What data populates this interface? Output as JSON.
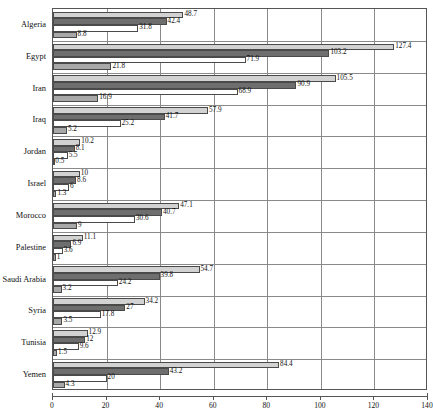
{
  "chart_data": {
    "type": "bar",
    "orientation": "horizontal",
    "title": "",
    "subtitle": "",
    "xlabel": "",
    "ylabel": "",
    "xlim": [
      0,
      140
    ],
    "xticks": [
      0,
      20,
      40,
      60,
      80,
      100,
      120,
      140
    ],
    "grid": true,
    "grid_axis": "x",
    "legend": false,
    "legend_position": "none",
    "categories": [
      "Algeria",
      "Egypt",
      "Iran",
      "Iraq",
      "Jordan",
      "Israel",
      "Morocco",
      "Palestine",
      "Saudi Arabia",
      "Syria",
      "Tunisia",
      "Yemen"
    ],
    "series": [
      {
        "name": "series-1",
        "color": "#d2d2d2",
        "values": [
          48.7,
          127.4,
          105.5,
          57.9,
          10.2,
          10,
          47.1,
          11.1,
          54.7,
          34.2,
          12.9,
          84.4
        ],
        "labels": [
          "48.7",
          "127.4",
          "105.5",
          "57.9",
          "10.2",
          "10",
          "47.1",
          "11.1",
          "54.7",
          "34.2",
          "12.9",
          "84.4"
        ]
      },
      {
        "name": "series-2",
        "color": "#6e6e6e",
        "values": [
          42.4,
          103.2,
          90.9,
          41.7,
          8.1,
          8.6,
          40.7,
          6.9,
          39.8,
          27,
          12,
          43.2
        ],
        "labels": [
          "42.4",
          "103.2",
          "90.9",
          "41.7",
          "8.1",
          "8.6",
          "40.7",
          "6.9",
          "39.8",
          "27",
          "12",
          "43.2"
        ]
      },
      {
        "name": "series-3",
        "color": "#ffffff",
        "values": [
          31.8,
          71.9,
          68.9,
          25.2,
          5.5,
          6,
          30.6,
          3.6,
          24.2,
          17.8,
          9.6,
          20
        ],
        "labels": [
          "31.8",
          "71.9",
          "68.9",
          "25.2",
          "5.5",
          "6",
          "30.6",
          "3.6",
          "24.2",
          "17.8",
          "9.6",
          "20"
        ]
      },
      {
        "name": "series-4",
        "color": "#a8a8a8",
        "values": [
          8.8,
          21.8,
          16.9,
          5.2,
          0.5,
          1.3,
          9,
          1,
          3.2,
          3.5,
          1.5,
          4.3
        ],
        "labels": [
          "8.8",
          "21.8",
          "16.9",
          "5.2",
          "0.5",
          "1.3",
          "9",
          "1",
          "3.2",
          "3.5",
          "1.5",
          "4.3"
        ]
      }
    ]
  }
}
